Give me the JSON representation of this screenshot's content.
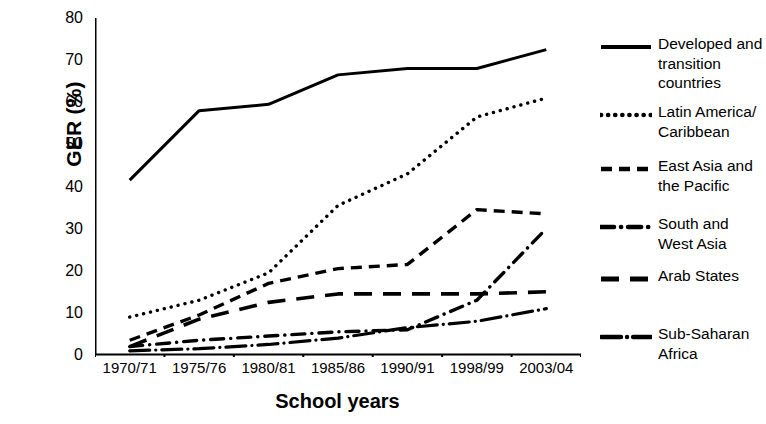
{
  "chart_data": {
    "type": "line",
    "title": "",
    "xlabel": "School years",
    "ylabel": "GER (%)",
    "categories": [
      "1970/71",
      "1975/76",
      "1980/81",
      "1985/86",
      "1990/91",
      "1998/99",
      "2003/04"
    ],
    "ylim": [
      0,
      80
    ],
    "yticks": [
      0,
      10,
      20,
      30,
      40,
      50,
      60,
      70,
      80
    ],
    "grid": false,
    "legend_position": "right",
    "series": [
      {
        "name": "Developed and transition countries",
        "style": "solid",
        "values": [
          41.5,
          58.0,
          59.5,
          66.5,
          68.0,
          68.0,
          72.5
        ]
      },
      {
        "name": "Latin America/ Caribbean",
        "style": "dotted",
        "values": [
          9.0,
          13.0,
          19.5,
          35.5,
          43.0,
          56.5,
          61.0
        ]
      },
      {
        "name": "East Asia and the Pacific",
        "style": "dashed",
        "values": [
          3.5,
          9.5,
          17.0,
          20.5,
          21.5,
          34.5,
          33.5
        ]
      },
      {
        "name": "South and West Asia",
        "style": "dash-dot",
        "values": [
          2.0,
          3.5,
          4.5,
          5.5,
          6.0,
          13.0,
          30.0
        ]
      },
      {
        "name": "Arab States",
        "style": "long-dash",
        "values": [
          2.0,
          8.5,
          12.5,
          14.5,
          14.5,
          14.5,
          15.0
        ]
      },
      {
        "name": "Sub-Saharan Africa",
        "style": "solid-dot",
        "values": [
          1.0,
          1.5,
          2.5,
          4.0,
          6.5,
          8.0,
          11.0
        ]
      }
    ]
  },
  "legend": {
    "items": [
      {
        "label": "Developed and transition countries",
        "key": "solid-line-key"
      },
      {
        "label": "Latin America/ Caribbean",
        "key": "dotted-line-key"
      },
      {
        "label": "East Asia and the Pacific",
        "key": "dashed-line-key"
      },
      {
        "label": "South and West Asia",
        "key": "dash-dot-line-key"
      },
      {
        "label": "Arab States",
        "key": "long-dash-line-key"
      },
      {
        "label": "Sub-Saharan Africa",
        "key": "solid-dot-line-key"
      }
    ]
  },
  "axes": {
    "y_label": "GER (%)",
    "x_label": "School years",
    "y_ticks": [
      "80",
      "70",
      "60",
      "50",
      "40",
      "30",
      "20",
      "10",
      "0"
    ]
  },
  "colors": {
    "ink": "#000000",
    "background": "#ffffff"
  }
}
